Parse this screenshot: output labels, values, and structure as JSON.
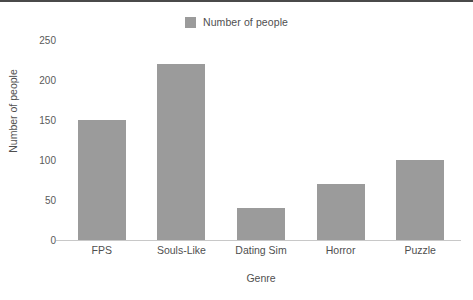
{
  "legend": {
    "entries": [
      {
        "label": "Number of people",
        "color": "#9b9b9b",
        "swatch_icon": "legend-swatch-icon"
      }
    ],
    "position": "top-center"
  },
  "colors": {
    "bar": "#9b9b9b",
    "axis": "#c8c8c8",
    "text": "#4f4f4f",
    "tick_text": "#5a5a5a",
    "background": "#ffffff",
    "top_border": "#4a4a4a"
  },
  "chart_data": {
    "type": "bar",
    "title": "",
    "subtitle": "",
    "xlabel": "Genre",
    "ylabel": "Number of people",
    "categories": [
      "FPS",
      "Souls-Like",
      "Dating Sim",
      "Horror",
      "Puzzle"
    ],
    "series": [
      {
        "name": "Number of people",
        "values": [
          150,
          220,
          40,
          70,
          100
        ],
        "color": "#9b9b9b"
      }
    ],
    "values": [
      150,
      220,
      40,
      70,
      100
    ],
    "ylim": [
      0,
      250
    ],
    "yticks": [
      0,
      50,
      100,
      150,
      200,
      250
    ],
    "ytick_labels": [
      "0",
      "50",
      "100",
      "150",
      "200",
      "250"
    ],
    "xtick_labels": [
      "FPS",
      "Souls-Like",
      "Dating Sim",
      "Horror",
      "Puzzle"
    ],
    "grid": false,
    "legend": "top-center",
    "bar_orientation": "vertical"
  }
}
